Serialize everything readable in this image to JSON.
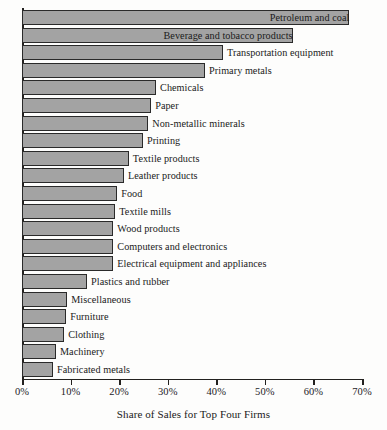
{
  "chart_data": {
    "type": "bar",
    "orientation": "horizontal",
    "title": "",
    "xlabel": "Share of Sales for Top Four Firms",
    "ylabel": "",
    "xlim": [
      0,
      70
    ],
    "grid": false,
    "legend": null,
    "tick_labels": [
      "0%",
      "10%",
      "20%",
      "30%",
      "40%",
      "50%",
      "60%",
      "70%"
    ],
    "tick_values": [
      0,
      10,
      20,
      30,
      40,
      50,
      60,
      70
    ],
    "categories": [
      "Petroleum and coal",
      "Beverage and tobacco products",
      "Transportation equipment",
      "Primary metals",
      "Chemicals",
      "Paper",
      "Non-metallic minerals",
      "Printing",
      "Textile products",
      "Leather products",
      "Food",
      "Textile mills",
      "Wood products",
      "Computers and electronics",
      "Electrical equipment and appliances",
      "Plastics and rubber",
      "Miscellaneous",
      "Furniture",
      "Clothing",
      "Machinery",
      "Fabricated metals"
    ],
    "values": [
      67.4,
      55.7,
      41.4,
      37.7,
      27.6,
      26.6,
      26.0,
      24.9,
      22.0,
      21.0,
      19.6,
      19.2,
      18.8,
      18.8,
      18.8,
      13.4,
      9.3,
      9.1,
      8.7,
      7.0,
      6.4
    ],
    "bars": [
      {
        "label": "Petroleum and coal",
        "value": 67.4,
        "label_position": "inside"
      },
      {
        "label": "Beverage and tobacco products",
        "value": 55.7,
        "label_position": "inside"
      },
      {
        "label": "Transportation equipment",
        "value": 41.4,
        "label_position": "outside"
      },
      {
        "label": "Primary metals",
        "value": 37.7,
        "label_position": "outside"
      },
      {
        "label": "Chemicals",
        "value": 27.6,
        "label_position": "outside"
      },
      {
        "label": "Paper",
        "value": 26.6,
        "label_position": "outside"
      },
      {
        "label": "Non-metallic minerals",
        "value": 26.0,
        "label_position": "outside"
      },
      {
        "label": "Printing",
        "value": 24.9,
        "label_position": "outside"
      },
      {
        "label": "Textile products",
        "value": 22.0,
        "label_position": "outside"
      },
      {
        "label": "Leather products",
        "value": 21.0,
        "label_position": "outside"
      },
      {
        "label": "Food",
        "value": 19.6,
        "label_position": "outside"
      },
      {
        "label": "Textile mills",
        "value": 19.2,
        "label_position": "outside"
      },
      {
        "label": "Wood products",
        "value": 18.8,
        "label_position": "outside"
      },
      {
        "label": "Computers and electronics",
        "value": 18.8,
        "label_position": "outside"
      },
      {
        "label": "Electrical equipment and appliances",
        "value": 18.8,
        "label_position": "outside"
      },
      {
        "label": "Plastics and rubber",
        "value": 13.4,
        "label_position": "outside"
      },
      {
        "label": "Miscellaneous",
        "value": 9.3,
        "label_position": "outside"
      },
      {
        "label": "Furniture",
        "value": 9.1,
        "label_position": "outside"
      },
      {
        "label": "Clothing",
        "value": 8.7,
        "label_position": "outside"
      },
      {
        "label": "Machinery",
        "value": 7.0,
        "label_position": "outside"
      },
      {
        "label": "Fabricated metals",
        "value": 6.4,
        "label_position": "outside"
      }
    ],
    "colors": {
      "bar_fill": "#a3a3a3",
      "bar_border": "#2a2a2a",
      "axis": "#23211f",
      "text": "#1a1a1a",
      "background": "#fdfdfc"
    }
  }
}
